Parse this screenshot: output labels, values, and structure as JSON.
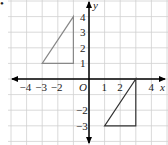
{
  "bullet": "•",
  "axes": {
    "x_label": "x",
    "y_label": "y",
    "origin_label": "O"
  },
  "x_ticks": [
    {
      "v": -4,
      "t": "−4"
    },
    {
      "v": -3,
      "t": "−3"
    },
    {
      "v": -2,
      "t": "−2"
    },
    {
      "v": 1,
      "t": "1"
    },
    {
      "v": 2,
      "t": "2"
    },
    {
      "v": 4,
      "t": "4"
    }
  ],
  "y_ticks": [
    {
      "v": 4,
      "t": "4"
    },
    {
      "v": 3,
      "t": "3"
    },
    {
      "v": 2,
      "t": "2"
    },
    {
      "v": 1,
      "t": "1"
    },
    {
      "v": -2,
      "t": "−2"
    },
    {
      "v": -3,
      "t": "−3"
    }
  ],
  "shapes": [
    {
      "name": "triangle-quadrant-2",
      "points": [
        [
          -3,
          1
        ],
        [
          -1,
          1
        ],
        [
          -1,
          4
        ]
      ],
      "color": "#888888"
    },
    {
      "name": "triangle-quadrant-4",
      "points": [
        [
          1,
          -3
        ],
        [
          3,
          -3
        ],
        [
          3,
          0
        ]
      ],
      "color": "#333333"
    }
  ],
  "grid": {
    "xmin": -5,
    "xmax": 4.5,
    "ymin": -4,
    "ymax": 5,
    "color": "#d0d0d0"
  }
}
